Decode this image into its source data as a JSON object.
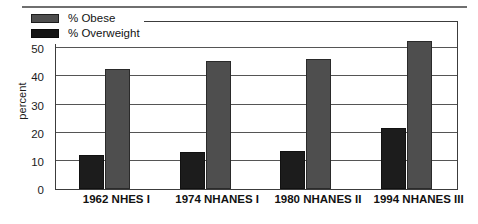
{
  "chart_data": {
    "type": "bar",
    "title": "",
    "xlabel": "",
    "ylabel": "percent",
    "ylim": [
      0,
      60
    ],
    "yticks": [
      0,
      10,
      20,
      30,
      40,
      50,
      60
    ],
    "grid": "horizontal",
    "legend_position": "top-left inside plot",
    "categories": [
      "1962 NHES I",
      "1974 NHANES I",
      "1980 NHANES II",
      "1994 NHANES III"
    ],
    "series": [
      {
        "name": "% Overweight",
        "color": "#1c1c1c",
        "values": [
          12,
          13,
          13.5,
          21.5
        ]
      },
      {
        "name": "% Obese",
        "color": "#4e4e4e",
        "values": [
          42.5,
          45.5,
          46,
          52.5
        ]
      }
    ]
  },
  "legend": {
    "items": [
      {
        "label": "% Obese",
        "swatch": "obese"
      },
      {
        "label": "% Overweight",
        "swatch": "overweight"
      }
    ]
  },
  "axis": {
    "y_title": "percent"
  }
}
